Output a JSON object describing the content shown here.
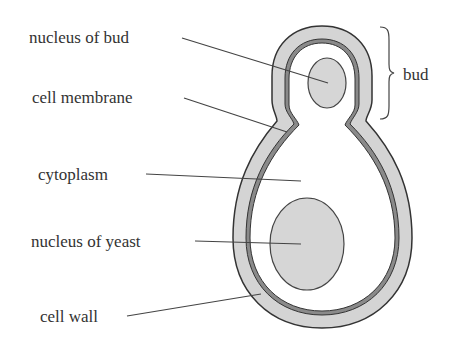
{
  "diagram": {
    "labels": {
      "nucleus_of_bud": "nucleus of bud",
      "cell_membrane": "cell membrane",
      "cytoplasm": "cytoplasm",
      "nucleus_of_yeast": "nucleus of yeast",
      "cell_wall": "cell wall",
      "bud": "bud"
    },
    "colors": {
      "wall_fill": "#d4d4d4",
      "membrane": "#888888",
      "outline": "#333333",
      "nucleus_fill": "#d6d6d6",
      "cytoplasm": "#ffffff"
    }
  }
}
